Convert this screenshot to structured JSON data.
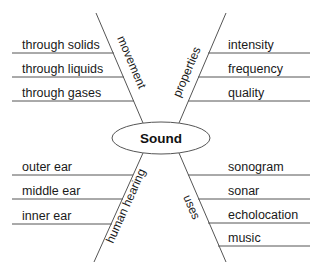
{
  "diagram": {
    "type": "spider-map",
    "center": "Sound",
    "branches": [
      {
        "label": "movement",
        "position": "top-left",
        "details": [
          "through solids",
          "through liquids",
          "through gases"
        ]
      },
      {
        "label": "properties",
        "position": "top-right",
        "details": [
          "intensity",
          "frequency",
          "quality"
        ]
      },
      {
        "label": "human hearing",
        "position": "bottom-left",
        "details": [
          "outer ear",
          "middle ear",
          "inner ear"
        ]
      },
      {
        "label": "uses",
        "position": "bottom-right",
        "details": [
          "sonogram",
          "sonar",
          "echolocation",
          "music"
        ]
      }
    ]
  },
  "colors": {
    "line": "#555555",
    "text": "#1a1a1a",
    "background": "#ffffff"
  }
}
